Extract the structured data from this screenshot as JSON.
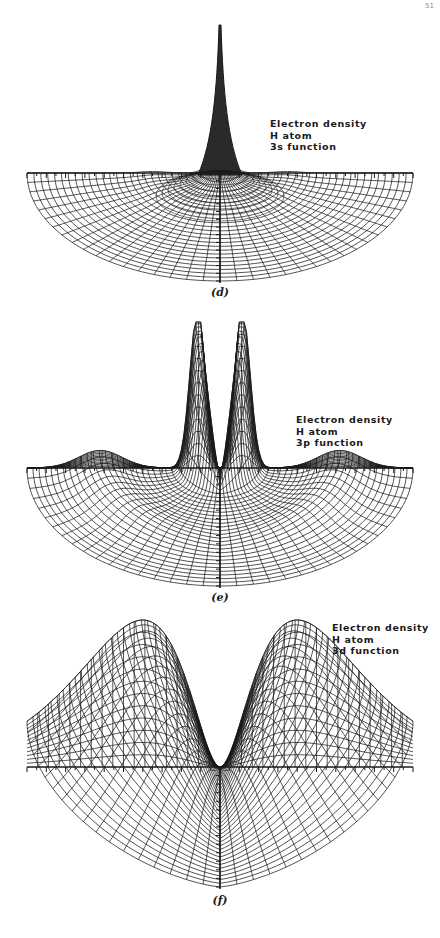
{
  "page": {
    "page_mark": "51"
  },
  "figures": [
    {
      "id": "d",
      "caption": "(d)",
      "legend": [
        "Electron density",
        "H atom",
        "3s function"
      ],
      "orbital": "3s",
      "surface": "single sharp central peak",
      "top": 0,
      "height": 300,
      "axis_y": 173,
      "peak_top_y": 25,
      "center_x": 220,
      "radius": 193,
      "bowl_depth": 108,
      "legend_pos": [
        270,
        118
      ],
      "caption_pos": [
        200,
        293
      ]
    },
    {
      "id": "e",
      "caption": "(e)",
      "legend": [
        "Electron density",
        "H atom",
        "3p function"
      ],
      "orbital": "3p",
      "surface": "two sharp peaks flanking the nucleus plus a low outer ring",
      "top": 300,
      "height": 310,
      "axis_y": 468,
      "peak_top_y": 322,
      "center_x": 220,
      "radius": 193,
      "bowl_depth": 118,
      "legend_pos": [
        296,
        414
      ],
      "caption_pos": [
        200,
        597
      ]
    },
    {
      "id": "f",
      "caption": "(f)",
      "legend": [
        "Electron density",
        "H atom",
        "3d function"
      ],
      "orbital": "3d",
      "surface": "two broad lobes with node at nucleus",
      "top": 610,
      "height": 328,
      "axis_y": 767,
      "peak_top_y": 620,
      "center_x": 220,
      "radius": 193,
      "bowl_depth": 120,
      "legend_pos": [
        332,
        622
      ],
      "caption_pos": [
        200,
        898
      ]
    }
  ],
  "colors": {
    "ink": "#1a1a1a",
    "paper": "#ffffff"
  }
}
